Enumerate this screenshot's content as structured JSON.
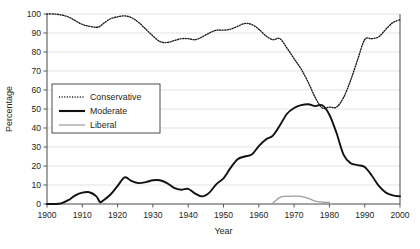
{
  "chart_data": {
    "type": "line",
    "title": "",
    "xlabel": "Year",
    "ylabel": "Percentage",
    "xlim": [
      1900,
      2000
    ],
    "ylim": [
      0,
      100
    ],
    "grid": true,
    "legend_position": "upper-left-inside",
    "xticks": [
      1900,
      1910,
      1920,
      1930,
      1940,
      1950,
      1960,
      1970,
      1980,
      1990,
      2000
    ],
    "xticklabels": [
      "1900",
      "1910",
      "1920",
      "1930",
      "1940",
      "1950",
      "1960",
      "1970",
      "1980",
      "1990",
      "2000"
    ],
    "yticks": [
      0,
      10,
      20,
      30,
      40,
      50,
      60,
      70,
      80,
      90,
      100
    ],
    "yticklabels": [
      "0",
      "10",
      "20",
      "30",
      "40",
      "50",
      "60",
      "70",
      "80",
      "90",
      "100"
    ],
    "x": [
      1900,
      1902,
      1904,
      1906,
      1908,
      1910,
      1912,
      1914,
      1915,
      1916,
      1918,
      1920,
      1922,
      1924,
      1926,
      1928,
      1930,
      1932,
      1934,
      1936,
      1938,
      1940,
      1942,
      1944,
      1946,
      1948,
      1950,
      1952,
      1954,
      1956,
      1958,
      1960,
      1962,
      1964,
      1966,
      1968,
      1970,
      1972,
      1974,
      1976,
      1978,
      1980,
      1982,
      1984,
      1986,
      1988,
      1990,
      1992,
      1994,
      1996,
      1998,
      2000
    ],
    "series": [
      {
        "name": "Conservative",
        "style": "dotted",
        "color": "#1a1a1a",
        "values": [
          100,
          100,
          99.5,
          98.5,
          96.5,
          94.5,
          93.5,
          93,
          93.5,
          95,
          97.5,
          98.5,
          99,
          98,
          95.5,
          92,
          88.5,
          85.5,
          85,
          86,
          87,
          87,
          86.5,
          88,
          90,
          91.5,
          91.5,
          92,
          93.5,
          95,
          94.5,
          92,
          88.5,
          86.5,
          87,
          82,
          76.5,
          71,
          64,
          56,
          50.5,
          51,
          51,
          56,
          65,
          76,
          86.5,
          87,
          88,
          92,
          95.5,
          97
        ]
      },
      {
        "name": "Moderate",
        "style": "solid-thick",
        "color": "#111111",
        "values": [
          0,
          0,
          0.3,
          2,
          4.5,
          6,
          6.2,
          4,
          1,
          2,
          5,
          9.5,
          14,
          12,
          11,
          11.5,
          12.5,
          12.5,
          11,
          8.5,
          7.5,
          8,
          5.5,
          4,
          6,
          10.5,
          13.5,
          19,
          23.5,
          25,
          26,
          30.5,
          34,
          36,
          41.5,
          47.5,
          50.5,
          52,
          52.5,
          51.5,
          52,
          47,
          37.5,
          26,
          21.5,
          20.5,
          19.5,
          15,
          9.5,
          6,
          4.5,
          4
        ]
      },
      {
        "name": "Liberal",
        "style": "solid-thin",
        "color": "#9d9d9f",
        "values": [
          null,
          null,
          null,
          null,
          null,
          null,
          null,
          null,
          null,
          null,
          null,
          null,
          null,
          null,
          null,
          null,
          null,
          null,
          null,
          null,
          null,
          null,
          null,
          null,
          null,
          null,
          null,
          null,
          null,
          null,
          null,
          null,
          null,
          0.5,
          3.5,
          4,
          4.2,
          4,
          3,
          1.5,
          1,
          0.8,
          null,
          null,
          null,
          null,
          null,
          null,
          null,
          null,
          null,
          null
        ]
      }
    ]
  },
  "legend": {
    "items": [
      {
        "label": "Conservative"
      },
      {
        "label": "Moderate"
      },
      {
        "label": "Liberal"
      }
    ]
  }
}
